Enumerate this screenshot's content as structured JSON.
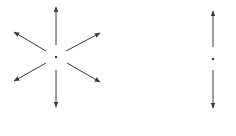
{
  "diagram": {
    "background": "#ffffff",
    "stroke_color": "#3a3a3a",
    "figures": [
      {
        "name": "radial-star",
        "center": [
          56,
          57
        ],
        "arrows": [
          {
            "direction": "up",
            "from": [
              56,
              45
            ],
            "to": [
              56,
              7
            ]
          },
          {
            "direction": "down",
            "from": [
              56,
              70
            ],
            "to": [
              56,
              107
            ]
          },
          {
            "direction": "up-left",
            "from": [
              46,
              51
            ],
            "to": [
              14,
              32
            ]
          },
          {
            "direction": "up-right",
            "from": [
              66,
              51
            ],
            "to": [
              100,
              33
            ]
          },
          {
            "direction": "down-left",
            "from": [
              46,
              63
            ],
            "to": [
              14,
              81
            ]
          },
          {
            "direction": "down-right",
            "from": [
              67,
              63
            ],
            "to": [
              100,
              82
            ]
          }
        ]
      },
      {
        "name": "vertical-double-arrow",
        "center": [
          213,
          59
        ],
        "arrows": [
          {
            "direction": "up",
            "from": [
              213,
              47
            ],
            "to": [
              213,
              11
            ]
          },
          {
            "direction": "down",
            "from": [
              213,
              70
            ],
            "to": [
              213,
              108
            ]
          }
        ]
      }
    ]
  }
}
